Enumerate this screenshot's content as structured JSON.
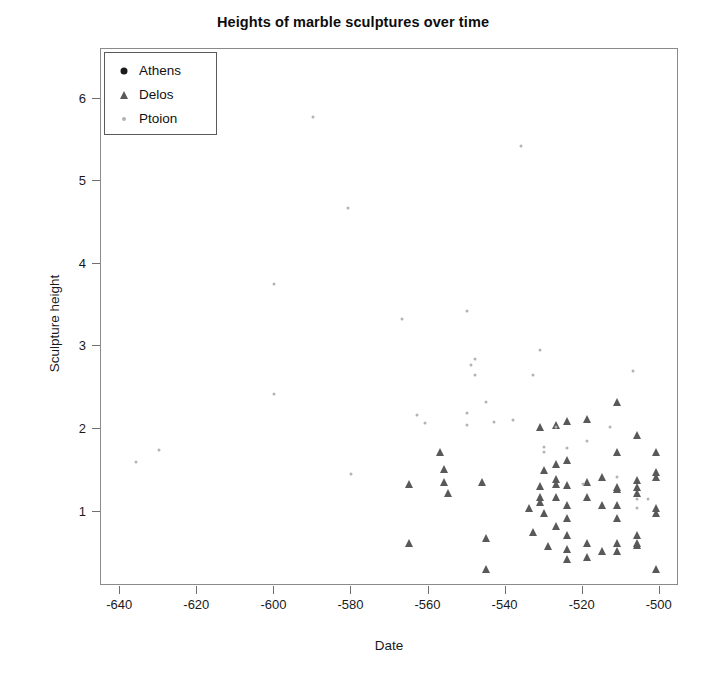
{
  "chart_data": {
    "type": "scatter",
    "title": "Heights of marble sculptures over time",
    "xlabel": "Date",
    "ylabel": "Sculpture height",
    "xlim": [
      -645,
      -495
    ],
    "ylim": [
      0.1,
      6.6
    ],
    "xticks": [
      -640,
      -620,
      -600,
      -580,
      -560,
      -540,
      -520,
      -500
    ],
    "xticklabels": [
      "-640",
      "-620",
      "-600",
      "-580",
      "-560",
      "-540",
      "-520",
      "-500"
    ],
    "yticks": [
      1,
      2,
      3,
      4,
      5,
      6
    ],
    "yticklabels": [
      "1",
      "2",
      "3",
      "4",
      "5",
      "6"
    ],
    "grid": false,
    "legend_position": "top-left",
    "series": [
      {
        "name": "Athens",
        "marker": "circle",
        "color": "#1c1c1c",
        "size": 5,
        "points": []
      },
      {
        "name": "Delos",
        "marker": "triangle",
        "color": "#595959",
        "size": 8,
        "points": [
          [
            -565,
            1.33
          ],
          [
            -565,
            0.62
          ],
          [
            -557,
            1.72
          ],
          [
            -556,
            1.52
          ],
          [
            -556,
            1.36
          ],
          [
            -555,
            1.22
          ],
          [
            -546,
            1.36
          ],
          [
            -545,
            0.68
          ],
          [
            -545,
            0.3
          ],
          [
            -534,
            1.04
          ],
          [
            -533,
            0.75
          ],
          [
            -531,
            2.03
          ],
          [
            -531,
            1.31
          ],
          [
            -531,
            1.18
          ],
          [
            -531,
            1.12
          ],
          [
            -530,
            1.5
          ],
          [
            -530,
            0.98
          ],
          [
            -529,
            0.58
          ],
          [
            -527,
            2.05
          ],
          [
            -527,
            1.58
          ],
          [
            -527,
            1.4
          ],
          [
            -527,
            1.33
          ],
          [
            -527,
            1.18
          ],
          [
            -527,
            0.83
          ],
          [
            -524,
            2.1
          ],
          [
            -524,
            1.62
          ],
          [
            -524,
            1.32
          ],
          [
            -524,
            1.08
          ],
          [
            -524,
            0.92
          ],
          [
            -524,
            0.72
          ],
          [
            -524,
            0.55
          ],
          [
            -524,
            0.43
          ],
          [
            -519,
            2.12
          ],
          [
            -519,
            1.36
          ],
          [
            -519,
            1.18
          ],
          [
            -519,
            0.62
          ],
          [
            -519,
            0.45
          ],
          [
            -515,
            1.42
          ],
          [
            -515,
            1.08
          ],
          [
            -515,
            0.52
          ],
          [
            -511,
            2.33
          ],
          [
            -511,
            1.72
          ],
          [
            -511,
            1.3
          ],
          [
            -511,
            1.28
          ],
          [
            -511,
            1.08
          ],
          [
            -511,
            0.92
          ],
          [
            -511,
            0.62
          ],
          [
            -511,
            0.52
          ],
          [
            -506,
            1.93
          ],
          [
            -506,
            1.38
          ],
          [
            -506,
            1.3
          ],
          [
            -506,
            1.22
          ],
          [
            -506,
            0.72
          ],
          [
            -506,
            0.62
          ],
          [
            -506,
            0.6
          ],
          [
            -501,
            1.72
          ],
          [
            -501,
            1.48
          ],
          [
            -501,
            1.42
          ],
          [
            -501,
            1.05
          ],
          [
            -501,
            0.98
          ],
          [
            -501,
            0.3
          ]
        ]
      },
      {
        "name": "Ptoion",
        "marker": "dot",
        "color": "#b3b3b3",
        "size": 3,
        "points": [
          [
            -636,
            1.6
          ],
          [
            -630,
            1.75
          ],
          [
            -600,
            3.75
          ],
          [
            -600,
            2.42
          ],
          [
            -590,
            5.78
          ],
          [
            -581,
            4.67
          ],
          [
            -580,
            1.45
          ],
          [
            -567,
            3.33
          ],
          [
            -563,
            2.17
          ],
          [
            -561,
            2.07
          ],
          [
            -550,
            3.43
          ],
          [
            -550,
            2.19
          ],
          [
            -550,
            2.05
          ],
          [
            -549,
            2.77
          ],
          [
            -548,
            2.85
          ],
          [
            -548,
            2.66
          ],
          [
            -545,
            2.33
          ],
          [
            -543,
            2.08
          ],
          [
            -538,
            2.11
          ],
          [
            -536,
            5.42
          ],
          [
            -533,
            2.65
          ],
          [
            -531,
            2.96
          ],
          [
            -530,
            1.78
          ],
          [
            -530,
            1.72
          ],
          [
            -527,
            2.02
          ],
          [
            -524,
            1.77
          ],
          [
            -520,
            1.33
          ],
          [
            -519,
            1.85
          ],
          [
            -513,
            2.02
          ],
          [
            -511,
            1.42
          ],
          [
            -507,
            2.7
          ],
          [
            -506,
            1.15
          ],
          [
            -506,
            1.05
          ],
          [
            -503,
            1.15
          ]
        ]
      }
    ]
  },
  "legend": {
    "entries": [
      {
        "label": "Athens"
      },
      {
        "label": "Delos"
      },
      {
        "label": "Ptoion"
      }
    ]
  }
}
